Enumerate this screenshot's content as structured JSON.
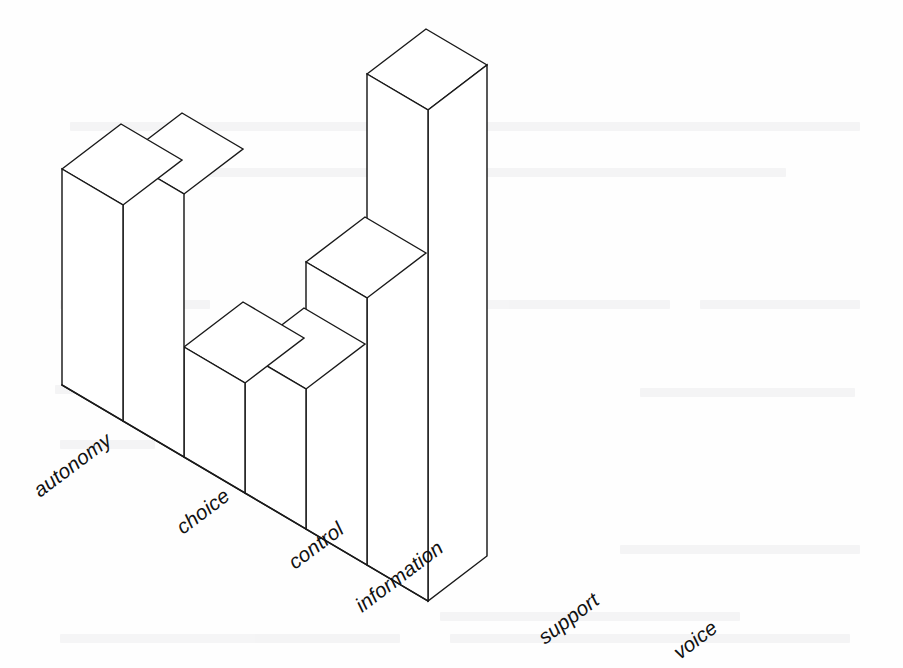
{
  "figure": {
    "kind": "3d-bar-chart",
    "background_color": "#fefefe",
    "ink_color": "#1a1a1a",
    "label_style": "italic-rotated",
    "label_rotation_degrees": -37,
    "has_axes": false,
    "has_gridlines": false,
    "has_value_labels": false,
    "has_title": false,
    "scan_artifact": "faint verso text bleed-through"
  },
  "chart_data": {
    "type": "bar",
    "title": "",
    "subtitle": "",
    "xlabel": "",
    "ylabel": "",
    "categories": [
      "autonomy",
      "choice",
      "control",
      "information",
      "support",
      "voice"
    ],
    "values": [
      45,
      55,
      23,
      30,
      56,
      100
    ],
    "ylim": [
      0,
      100
    ],
    "grid": false,
    "legend": false,
    "legend_position": "none",
    "annotations": [],
    "tick_labels": {
      "x": [
        "autonomy",
        "choice",
        "control",
        "information",
        "support",
        "voice"
      ],
      "y": []
    },
    "projection": "isometric-3d",
    "bar_pixel_heights": [
      216,
      265,
      113,
      144,
      271,
      483
    ]
  },
  "geometry": {
    "origin_x": 62,
    "origin_y": 385,
    "step_x": 61,
    "step_y": 36,
    "depth_x": 59,
    "depth_y": -45,
    "bar_top_y": [
      169,
      158,
      347,
      353,
      262,
      74
    ]
  },
  "bars": [
    {
      "label": "autonomy",
      "value": 45,
      "top_y": 169
    },
    {
      "label": "choice",
      "value": 55,
      "top_y": 158
    },
    {
      "label": "control",
      "value": 23,
      "top_y": 347
    },
    {
      "label": "information",
      "value": 30,
      "top_y": 353
    },
    {
      "label": "support",
      "value": 56,
      "top_y": 262
    },
    {
      "label": "voice",
      "value": 100,
      "top_y": 74
    }
  ],
  "labels": [
    {
      "text": "autonomy",
      "x": 40,
      "y": 498
    },
    {
      "text": "choice",
      "x": 183,
      "y": 535
    },
    {
      "text": "control",
      "x": 295,
      "y": 570
    },
    {
      "text": "information",
      "x": 362,
      "y": 613
    },
    {
      "text": "support",
      "x": 545,
      "y": 645
    },
    {
      "text": "voice",
      "x": 680,
      "y": 660
    }
  ]
}
